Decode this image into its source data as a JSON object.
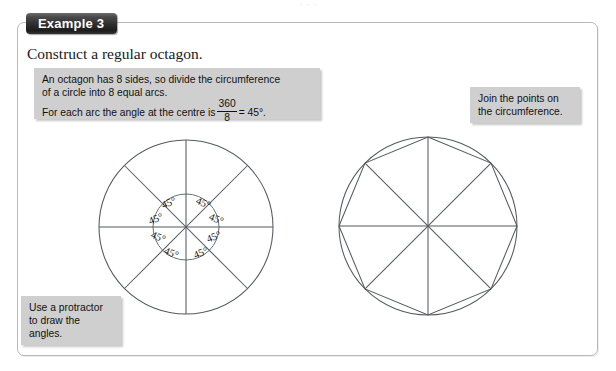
{
  "page": {
    "top_sliver_text": "· · ·",
    "background_color": "#ffffff",
    "frame_border_color": "#b9b9bd"
  },
  "example": {
    "tab_label": "Example 3",
    "tab_color": "#242424",
    "tab_text_color": "#ffffff",
    "headline": "Construct a regular octagon."
  },
  "callouts": {
    "box_color": "#cfcfcf",
    "octagon_arcs": {
      "line1": "An octagon has 8 sides, so divide the circumference",
      "line2": "of a circle into 8 equal arcs.",
      "line3_prefix": "For each arc the angle at the centre is",
      "fraction_numerator": "360",
      "fraction_denominator": "8",
      "line3_suffix": "= 45°."
    },
    "join_points": {
      "line1": "Join the points on",
      "line2": "the circumference."
    },
    "protractor": {
      "line1": "Use a protractor",
      "line2": "to draw the",
      "line3": "angles."
    }
  },
  "figures": {
    "stroke_color": "#555a60",
    "left": {
      "title": "circle divided into 8 equal arcs with 45 degree angles",
      "center_x": 186,
      "center_y": 227,
      "radius": 87,
      "inner_circle_radius": 33,
      "radii_count": 8,
      "angle_value": "45°",
      "angle_labels": [
        "45°",
        "45°",
        "45°",
        "45°",
        "45°",
        "45°",
        "45°",
        "45°"
      ]
    },
    "right": {
      "title": "regular octagon inscribed in a circle with 8 radii",
      "center_x": 428,
      "center_y": 226,
      "radius": 89,
      "octagon_sides": 8,
      "radii_count": 8
    }
  }
}
